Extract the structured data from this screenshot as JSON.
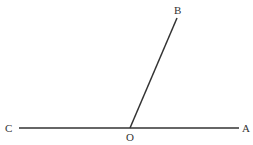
{
  "diagram": {
    "type": "angle-figure",
    "stroke_color": "#333333",
    "points": {
      "C": {
        "label": "C",
        "x": 19,
        "y": 128
      },
      "O": {
        "label": "O",
        "x": 130,
        "y": 128
      },
      "A": {
        "label": "A",
        "x": 239,
        "y": 128
      },
      "B": {
        "label": "B",
        "x": 177,
        "y": 18
      }
    },
    "segments": [
      {
        "from": "C",
        "to": "A"
      },
      {
        "from": "O",
        "to": "B"
      }
    ]
  }
}
